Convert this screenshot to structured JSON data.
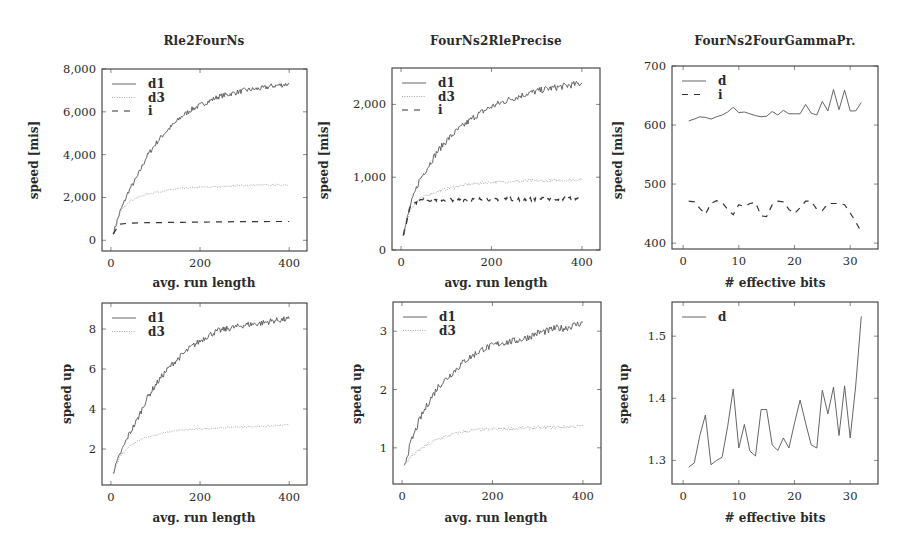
{
  "figure": {
    "background": "#ffffff",
    "line_color": "#555555",
    "dotted_color": "#9a9a9a",
    "dashed_color": "#333333"
  },
  "chart_data": [
    {
      "type": "line",
      "title": "Rle2FourNs",
      "xlabel": "avg. run length",
      "ylabel": "speed [mis]",
      "xlim": [
        -20,
        440
      ],
      "ylim": [
        -500,
        8000
      ],
      "xticks": [
        0,
        200,
        400
      ],
      "xtick_labels": [
        "0",
        "200",
        "400"
      ],
      "yticks": [
        0,
        2000,
        4000,
        6000,
        8000
      ],
      "ytick_labels": [
        "0",
        "2,000",
        "4,000",
        "6,000",
        "8,000"
      ],
      "legend_position": "upper left",
      "series": [
        {
          "name": "d1",
          "style": "solid",
          "jitter": 120,
          "x": [
            5,
            20,
            40,
            60,
            80,
            100,
            120,
            140,
            160,
            180,
            200,
            220,
            240,
            260,
            280,
            300,
            320,
            340,
            360,
            380,
            400
          ],
          "y": [
            300,
            1300,
            2300,
            3000,
            3900,
            4500,
            5000,
            5400,
            5800,
            6100,
            6300,
            6500,
            6700,
            6800,
            6900,
            7000,
            7050,
            7100,
            7200,
            7250,
            7300
          ]
        },
        {
          "name": "d3",
          "style": "dotted",
          "jitter": 40,
          "x": [
            5,
            20,
            40,
            60,
            80,
            100,
            120,
            140,
            160,
            180,
            200,
            240,
            280,
            320,
            360,
            400
          ],
          "y": [
            300,
            1300,
            1800,
            2000,
            2150,
            2250,
            2300,
            2380,
            2430,
            2450,
            2480,
            2500,
            2550,
            2570,
            2580,
            2600
          ]
        },
        {
          "name": "i",
          "style": "dashed",
          "jitter": 0,
          "x": [
            5,
            20,
            40,
            80,
            120,
            160,
            200,
            240,
            280,
            320,
            360,
            400
          ],
          "y": [
            300,
            750,
            800,
            820,
            830,
            840,
            850,
            860,
            870,
            870,
            880,
            880
          ]
        }
      ]
    },
    {
      "type": "line",
      "title": "FourNs2RlePrecise",
      "xlabel": "avg. run length",
      "ylabel": "speed [mis]",
      "xlim": [
        -20,
        440
      ],
      "ylim": [
        0,
        2500
      ],
      "xticks": [
        0,
        200,
        400
      ],
      "xtick_labels": [
        "0",
        "200",
        "400"
      ],
      "yticks": [
        0,
        1000,
        2000
      ],
      "ytick_labels": [
        "0",
        "1,000",
        "2,000"
      ],
      "legend_position": "upper left",
      "series": [
        {
          "name": "d1",
          "style": "solid",
          "jitter": 45,
          "x": [
            5,
            20,
            40,
            60,
            80,
            100,
            120,
            140,
            160,
            180,
            200,
            220,
            240,
            260,
            280,
            300,
            320,
            340,
            360,
            380,
            400
          ],
          "y": [
            200,
            600,
            950,
            1150,
            1350,
            1500,
            1620,
            1720,
            1820,
            1900,
            1970,
            2020,
            2070,
            2110,
            2150,
            2180,
            2210,
            2230,
            2250,
            2270,
            2290
          ]
        },
        {
          "name": "d3",
          "style": "dotted",
          "jitter": 20,
          "x": [
            5,
            20,
            40,
            60,
            80,
            100,
            120,
            140,
            160,
            180,
            200,
            240,
            280,
            320,
            360,
            400
          ],
          "y": [
            200,
            550,
            700,
            760,
            800,
            840,
            870,
            890,
            910,
            920,
            930,
            940,
            950,
            950,
            960,
            970
          ]
        },
        {
          "name": "i",
          "style": "dashed",
          "jitter": 25,
          "x": [
            5,
            15,
            20,
            40,
            60,
            100,
            200,
            300,
            400
          ],
          "y": [
            200,
            450,
            600,
            680,
            690,
            690,
            700,
            700,
            710
          ]
        }
      ]
    },
    {
      "type": "line",
      "title": "FourNs2FourGammaPr.",
      "xlabel": "# effective bits",
      "ylabel": "speed [mis]",
      "xlim": [
        -2,
        35
      ],
      "ylim": [
        390,
        700
      ],
      "xticks": [
        0,
        10,
        20,
        30
      ],
      "xtick_labels": [
        "0",
        "10",
        "20",
        "30"
      ],
      "yticks": [
        400,
        500,
        600,
        700
      ],
      "ytick_labels": [
        "400",
        "500",
        "600",
        "700"
      ],
      "legend_position": "upper left",
      "series": [
        {
          "name": "d",
          "style": "solid",
          "jitter": 0,
          "x": [
            1,
            2,
            3,
            4,
            5,
            6,
            7,
            8,
            9,
            10,
            11,
            12,
            13,
            14,
            15,
            16,
            17,
            18,
            19,
            20,
            21,
            22,
            23,
            24,
            25,
            26,
            27,
            28,
            29,
            30,
            31,
            32
          ],
          "y": [
            607,
            610,
            614,
            613,
            610,
            614,
            617,
            622,
            630,
            621,
            622,
            619,
            616,
            614,
            615,
            623,
            617,
            625,
            619,
            619,
            619,
            635,
            620,
            617,
            640,
            624,
            660,
            626,
            659,
            624,
            624,
            638
          ]
        },
        {
          "name": "i",
          "style": "dashed",
          "jitter": 0,
          "x": [
            1,
            2,
            3,
            4,
            5,
            6,
            7,
            8,
            9,
            10,
            11,
            12,
            13,
            14,
            15,
            16,
            17,
            18,
            19,
            20,
            21,
            22,
            23,
            24,
            25,
            26,
            27,
            28,
            29,
            30,
            31,
            32
          ],
          "y": [
            471,
            470,
            459,
            449,
            467,
            472,
            469,
            457,
            448,
            465,
            462,
            467,
            469,
            446,
            445,
            465,
            471,
            470,
            457,
            450,
            460,
            471,
            471,
            457,
            455,
            467,
            467,
            467,
            465,
            451,
            436,
            419
          ]
        }
      ]
    },
    {
      "type": "line",
      "title": "",
      "xlabel": "avg. run length",
      "ylabel": "speed up",
      "xlim": [
        -20,
        440
      ],
      "ylim": [
        0.2,
        9.3
      ],
      "xticks": [
        0,
        200,
        400
      ],
      "xtick_labels": [
        "0",
        "200",
        "400"
      ],
      "yticks": [
        2,
        4,
        6,
        8
      ],
      "ytick_labels": [
        "2",
        "4",
        "6",
        "8"
      ],
      "legend_position": "upper left",
      "series": [
        {
          "name": "d1",
          "style": "solid",
          "jitter": 0.15,
          "x": [
            5,
            20,
            40,
            60,
            80,
            100,
            120,
            140,
            160,
            180,
            200,
            220,
            240,
            260,
            280,
            300,
            320,
            340,
            360,
            380,
            400
          ],
          "y": [
            0.8,
            1.7,
            2.7,
            3.5,
            4.5,
            5.2,
            5.8,
            6.3,
            6.7,
            7.1,
            7.4,
            7.7,
            7.9,
            8.0,
            8.1,
            8.2,
            8.25,
            8.3,
            8.4,
            8.45,
            8.5
          ]
        },
        {
          "name": "d3",
          "style": "dotted",
          "jitter": 0.04,
          "x": [
            5,
            20,
            40,
            60,
            80,
            100,
            120,
            140,
            160,
            200,
            240,
            280,
            320,
            360,
            400
          ],
          "y": [
            0.8,
            1.6,
            2.1,
            2.4,
            2.6,
            2.7,
            2.8,
            2.9,
            2.95,
            3.0,
            3.05,
            3.1,
            3.12,
            3.15,
            3.2
          ]
        }
      ]
    },
    {
      "type": "line",
      "title": "",
      "xlabel": "avg. run length",
      "ylabel": "speed up",
      "xlim": [
        -20,
        440
      ],
      "ylim": [
        0.38,
        3.5
      ],
      "xticks": [
        0,
        200,
        400
      ],
      "xtick_labels": [
        "0",
        "200",
        "400"
      ],
      "yticks": [
        1,
        2,
        3
      ],
      "ytick_labels": [
        "1",
        "2",
        "3"
      ],
      "legend_position": "upper left",
      "series": [
        {
          "name": "d1",
          "style": "solid",
          "jitter": 0.06,
          "x": [
            5,
            20,
            40,
            60,
            80,
            100,
            120,
            140,
            160,
            180,
            200,
            220,
            240,
            260,
            280,
            300,
            320,
            340,
            360,
            380,
            400
          ],
          "y": [
            0.7,
            1.1,
            1.5,
            1.8,
            2.05,
            2.2,
            2.35,
            2.5,
            2.6,
            2.7,
            2.75,
            2.8,
            2.82,
            2.85,
            2.9,
            2.97,
            3.0,
            3.05,
            3.05,
            3.1,
            3.15
          ]
        },
        {
          "name": "d3",
          "style": "dotted",
          "jitter": 0.03,
          "x": [
            5,
            20,
            40,
            60,
            80,
            100,
            120,
            140,
            160,
            200,
            240,
            280,
            320,
            360,
            400
          ],
          "y": [
            0.7,
            0.85,
            0.97,
            1.07,
            1.15,
            1.2,
            1.25,
            1.28,
            1.3,
            1.32,
            1.33,
            1.34,
            1.35,
            1.36,
            1.37
          ]
        }
      ]
    },
    {
      "type": "line",
      "title": "",
      "xlabel": "# effective bits",
      "ylabel": "speed up",
      "xlim": [
        -2,
        35
      ],
      "ylim": [
        1.262,
        1.555
      ],
      "xticks": [
        0,
        10,
        20,
        30
      ],
      "xtick_labels": [
        "0",
        "10",
        "20",
        "30"
      ],
      "yticks": [
        1.3,
        1.4,
        1.5
      ],
      "ytick_labels": [
        "1.3",
        "1.4",
        "1.5"
      ],
      "legend_position": "upper left",
      "series": [
        {
          "name": "d",
          "style": "solid",
          "jitter": 0,
          "x": [
            1,
            2,
            3,
            4,
            5,
            6,
            7,
            8,
            9,
            10,
            11,
            12,
            13,
            14,
            15,
            16,
            17,
            18,
            19,
            20,
            21,
            22,
            23,
            24,
            25,
            26,
            27,
            28,
            29,
            30,
            31,
            32
          ],
          "y": [
            1.289,
            1.296,
            1.34,
            1.373,
            1.293,
            1.3,
            1.305,
            1.355,
            1.415,
            1.32,
            1.358,
            1.315,
            1.307,
            1.382,
            1.382,
            1.325,
            1.316,
            1.336,
            1.32,
            1.36,
            1.397,
            1.36,
            1.325,
            1.32,
            1.413,
            1.375,
            1.418,
            1.34,
            1.42,
            1.336,
            1.42,
            1.532
          ]
        }
      ]
    }
  ]
}
